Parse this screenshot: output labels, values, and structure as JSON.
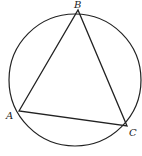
{
  "diagram": {
    "type": "inscribed triangle in circle",
    "circle": {
      "cx": 75,
      "cy": 80,
      "r": 66
    },
    "points": [
      {
        "label": "A",
        "x": 19,
        "y": 111,
        "lx": 6,
        "ly": 119
      },
      {
        "label": "B",
        "x": 78,
        "y": 10,
        "lx": 75,
        "ly": 7
      },
      {
        "label": "C",
        "x": 127,
        "y": 126,
        "lx": 129,
        "ly": 136
      }
    ],
    "stroke_color": "#222222"
  }
}
